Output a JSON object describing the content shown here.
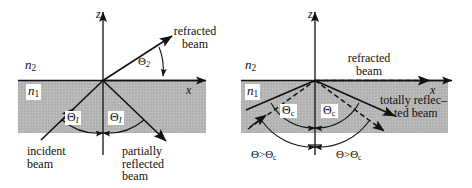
{
  "figure": {
    "panels": [
      {
        "id": "left",
        "name": "partial-reflection-refraction",
        "axes": {
          "x_label": "x",
          "z_label": "z"
        },
        "media": {
          "upper_label": "n",
          "upper_sub": "2",
          "lower_label": "n",
          "lower_sub": "1"
        },
        "angles": [
          {
            "symbol": "Θ",
            "sub": "I",
            "name": "incidence-angle"
          },
          {
            "symbol": "Θ",
            "sub": "I",
            "name": "reflection-angle"
          },
          {
            "symbol": "Θ",
            "sub": "2",
            "name": "refraction-angle"
          }
        ],
        "beams": [
          {
            "name": "refracted-beam",
            "label_line1": "refracted",
            "label_line2": "beam",
            "style": "solid"
          },
          {
            "name": "incident-beam",
            "label_line1": "incident",
            "label_line2": "beam",
            "style": "solid"
          },
          {
            "name": "partially-reflected-beam",
            "label_line1": "partially",
            "label_line2": "reflected",
            "label_line3": "beam",
            "style": "solid"
          }
        ]
      },
      {
        "id": "right",
        "name": "total-internal-reflection",
        "axes": {
          "x_label": "x",
          "z_label": "z"
        },
        "media": {
          "upper_label": "n",
          "upper_sub": "2",
          "lower_label": "n",
          "lower_sub": "1"
        },
        "angles": [
          {
            "symbol": "Θ",
            "sub": "c",
            "name": "critical-angle-left"
          },
          {
            "symbol": "Θ",
            "sub": "c",
            "name": "critical-angle-right"
          }
        ],
        "conditions": [
          {
            "text": "Θ>Θ",
            "sub": "c",
            "name": "beyond-critical-left"
          },
          {
            "text": "Θ>Θ",
            "sub": "c",
            "name": "beyond-critical-right"
          }
        ],
        "beams": [
          {
            "name": "refracted-beam",
            "label_line1": "refracted",
            "label_line2": "beam",
            "style": "dashed"
          },
          {
            "name": "totally-reflected-beam",
            "label_line1": "totally reflec–",
            "label_line2": "ted beam",
            "style": "solid"
          }
        ]
      }
    ]
  },
  "colors": {
    "ink": "#111111",
    "medium_fill": "#b5b5b5",
    "background": "#ffffff"
  }
}
